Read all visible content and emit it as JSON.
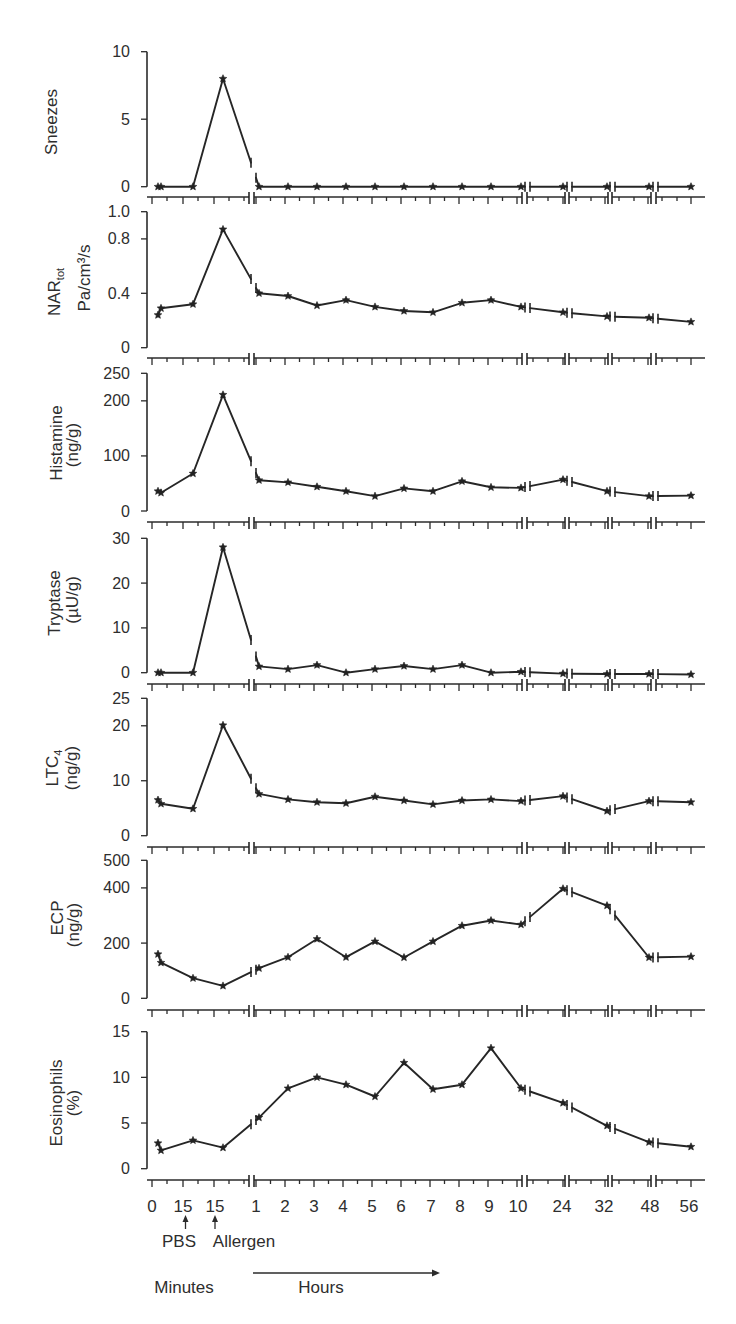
{
  "figure": {
    "x_axis": {
      "tick_labels": [
        "0",
        "15",
        "15",
        "1",
        "2",
        "3",
        "4",
        "5",
        "6",
        "7",
        "8",
        "9",
        "10",
        "24",
        "32",
        "48",
        "56"
      ],
      "event_markers": [
        {
          "label": "PBS"
        },
        {
          "label": "Allergen"
        }
      ],
      "unit_labels": {
        "minutes": "Minutes",
        "hours": "Hours"
      }
    }
  },
  "chart_data": [
    {
      "type": "line",
      "title": "",
      "ylabel": "Sneezes",
      "ylabel_sub": "",
      "ylabel_unit": "",
      "ylim": [
        0,
        10
      ],
      "yticks": [
        10,
        5,
        0
      ],
      "ytick_labels": [
        "10",
        "5",
        "0"
      ],
      "xlabel": "Minutes → Hours",
      "grid": false,
      "categories": [
        "0 min",
        "0 min",
        "15 min (PBS)",
        "15 min (Allergen)",
        "1 h",
        "2 h",
        "3 h",
        "4 h",
        "5 h",
        "6 h",
        "7 h",
        "8 h",
        "9 h",
        "10 h",
        "24 h",
        "32 h",
        "48 h",
        "56 h"
      ],
      "values": [
        0,
        0,
        0,
        8,
        0,
        0,
        0,
        0,
        0,
        0,
        0,
        0,
        0,
        0,
        0,
        0,
        0,
        0
      ]
    },
    {
      "type": "line",
      "title": "",
      "ylabel": "NAR",
      "ylabel_sub": "tot",
      "ylabel_unit": "Pa/cm³/s",
      "ylim": [
        0,
        1.0
      ],
      "yticks": [
        1.0,
        0.8,
        0.4,
        0
      ],
      "ytick_labels": [
        "1.0",
        "0.8",
        "0.4",
        "0"
      ],
      "xlabel": "Minutes → Hours",
      "grid": false,
      "categories": [
        "0 min",
        "0 min",
        "15 min (PBS)",
        "15 min (Allergen)",
        "1 h",
        "2 h",
        "3 h",
        "4 h",
        "5 h",
        "6 h",
        "7 h",
        "8 h",
        "9 h",
        "10 h",
        "24 h",
        "32 h",
        "48 h",
        "56 h"
      ],
      "values": [
        0.24,
        0.29,
        0.32,
        0.87,
        0.4,
        0.38,
        0.31,
        0.35,
        0.3,
        0.27,
        0.26,
        0.33,
        0.35,
        0.3,
        0.26,
        0.23,
        0.22,
        0.19
      ]
    },
    {
      "type": "line",
      "title": "",
      "ylabel": "Histamine",
      "ylabel_sub": "",
      "ylabel_unit": "(ng/g)",
      "ylim": [
        0,
        250
      ],
      "yticks": [
        250,
        200,
        100,
        0
      ],
      "ytick_labels": [
        "250",
        "200",
        "100",
        "0"
      ],
      "xlabel": "Minutes → Hours",
      "grid": false,
      "categories": [
        "0 min",
        "0 min",
        "15 min (PBS)",
        "15 min (Allergen)",
        "1 h",
        "2 h",
        "3 h",
        "4 h",
        "5 h",
        "6 h",
        "7 h",
        "8 h",
        "9 h",
        "10 h",
        "24 h",
        "32 h",
        "48 h",
        "56 h"
      ],
      "values": [
        36,
        33,
        68,
        211,
        56,
        52,
        44,
        36,
        27,
        41,
        36,
        54,
        43,
        42,
        57,
        36,
        27,
        28
      ]
    },
    {
      "type": "line",
      "title": "",
      "ylabel": "Tryptase",
      "ylabel_sub": "",
      "ylabel_unit": "(µU/g)",
      "ylim": [
        0,
        30
      ],
      "yticks": [
        30,
        20,
        10,
        0
      ],
      "ytick_labels": [
        "30",
        "20",
        "10",
        "0"
      ],
      "xlabel": "Minutes → Hours",
      "grid": false,
      "categories": [
        "0 min",
        "0 min",
        "15 min (PBS)",
        "15 min (Allergen)",
        "1 h",
        "2 h",
        "3 h",
        "4 h",
        "5 h",
        "6 h",
        "7 h",
        "8 h",
        "9 h",
        "10 h",
        "24 h",
        "32 h",
        "48 h",
        "56 h"
      ],
      "values": [
        0,
        0,
        0,
        28,
        1.4,
        0.8,
        1.7,
        0,
        0.8,
        1.5,
        0.8,
        1.7,
        0,
        0.2,
        -0.2,
        -0.3,
        -0.3,
        -0.4
      ]
    },
    {
      "type": "line",
      "title": "",
      "ylabel": "LTC",
      "ylabel_sub": "4",
      "ylabel_unit": "(ng/g)",
      "ylim": [
        0,
        25
      ],
      "yticks": [
        25,
        20,
        10,
        0
      ],
      "ytick_labels": [
        "25",
        "20",
        "10",
        "0"
      ],
      "xlabel": "Minutes → Hours",
      "grid": false,
      "categories": [
        "0 min",
        "0 min",
        "15 min (PBS)",
        "15 min (Allergen)",
        "1 h",
        "2 h",
        "3 h",
        "4 h",
        "5 h",
        "6 h",
        "7 h",
        "8 h",
        "9 h",
        "10 h",
        "24 h",
        "32 h",
        "48 h",
        "56 h"
      ],
      "values": [
        6.5,
        5.8,
        4.9,
        20.1,
        7.6,
        6.6,
        6.1,
        5.9,
        7.1,
        6.4,
        5.7,
        6.4,
        6.6,
        6.3,
        7.2,
        4.5,
        6.3,
        6.1
      ]
    },
    {
      "type": "line",
      "title": "",
      "ylabel": "ECP",
      "ylabel_sub": "",
      "ylabel_unit": "(ng/g)",
      "ylim": [
        0,
        500
      ],
      "yticks": [
        500,
        400,
        200,
        0
      ],
      "ytick_labels": [
        "500",
        "400",
        "200",
        "0"
      ],
      "xlabel": "Minutes → Hours",
      "grid": false,
      "categories": [
        "0 min",
        "0 min",
        "15 min (PBS)",
        "15 min (Allergen)",
        "1 h",
        "2 h",
        "3 h",
        "4 h",
        "5 h",
        "6 h",
        "7 h",
        "8 h",
        "9 h",
        "10 h",
        "24 h",
        "32 h",
        "48 h",
        "56 h"
      ],
      "values": [
        160,
        129,
        73,
        45,
        109,
        149,
        215,
        149,
        206,
        148,
        206,
        263,
        282,
        267,
        397,
        336,
        148,
        151
      ]
    },
    {
      "type": "line",
      "title": "",
      "ylabel": "Eosinophils",
      "ylabel_sub": "",
      "ylabel_unit": "(%)",
      "ylim": [
        0,
        15
      ],
      "yticks": [
        15,
        10,
        5,
        0
      ],
      "ytick_labels": [
        "15",
        "10",
        "5",
        "0"
      ],
      "xlabel": "Minutes → Hours",
      "grid": false,
      "categories": [
        "0 min",
        "0 min",
        "15 min (PBS)",
        "15 min (Allergen)",
        "1 h",
        "2 h",
        "3 h",
        "4 h",
        "5 h",
        "6 h",
        "7 h",
        "8 h",
        "9 h",
        "10 h",
        "24 h",
        "32 h",
        "48 h",
        "56 h"
      ],
      "values": [
        2.8,
        2.0,
        3.1,
        2.3,
        5.6,
        8.8,
        10.0,
        9.2,
        7.9,
        11.6,
        8.7,
        9.2,
        13.2,
        8.8,
        7.2,
        4.7,
        2.9,
        2.4
      ]
    }
  ]
}
